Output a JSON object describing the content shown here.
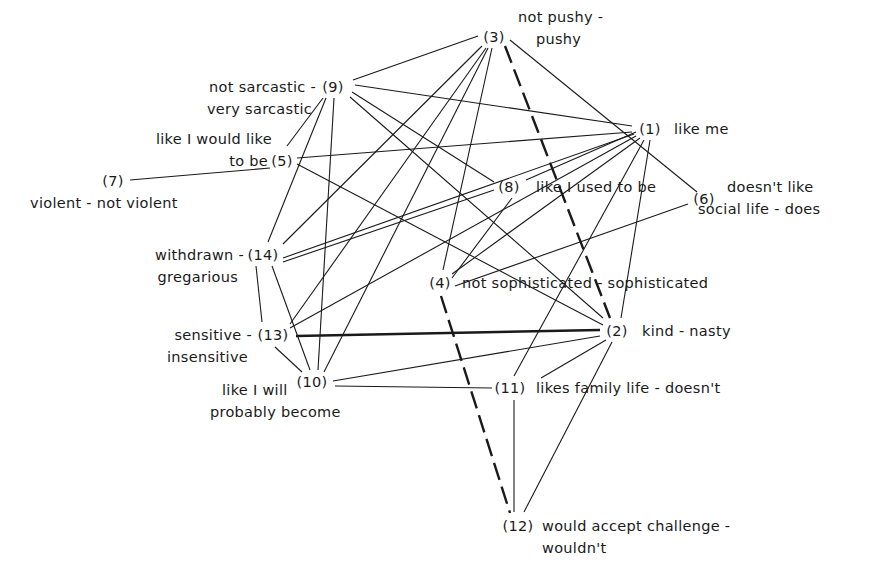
{
  "diagram": {
    "type": "correlation network (repertory grid constructs)",
    "nodes": [
      {
        "id": "1",
        "num": "(1)",
        "x": 650,
        "y": 128,
        "lines": [
          "like me"
        ],
        "label_x": 674,
        "label_y": 134,
        "num_anchor": "middle"
      },
      {
        "id": "2",
        "num": "(2)",
        "x": 617,
        "y": 330,
        "lines": [
          "kind - nasty"
        ],
        "label_x": 642,
        "label_y": 336,
        "num_anchor": "middle"
      },
      {
        "id": "3",
        "num": "(3)",
        "x": 494,
        "y": 36,
        "lines": [
          "not pushy -",
          "pushy"
        ],
        "label_x": 520,
        "label_y": 42,
        "num_anchor": "middle"
      },
      {
        "id": "4",
        "num": "(4)",
        "x": 440,
        "y": 282,
        "lines": [
          "not sophisticated - sophisticated"
        ],
        "label_x": 462,
        "label_y": 288,
        "num_anchor": "middle"
      },
      {
        "id": "5",
        "num": "(5)",
        "x": 282,
        "y": 160,
        "lines": [
          "like I would like",
          "to be"
        ],
        "label_x": 268,
        "label_y": 144,
        "num_anchor": "middle"
      },
      {
        "id": "6",
        "num": "(6)",
        "x": 704,
        "y": 198,
        "lines": [
          "doesn't like",
          "social life - does"
        ],
        "label_x": 727,
        "label_y": 204,
        "num_anchor": "middle"
      },
      {
        "id": "7",
        "num": "(7)",
        "x": 113,
        "y": 180,
        "lines": [
          "violent - not violent"
        ],
        "label_x": 30,
        "label_y": 208,
        "num_anchor": "middle"
      },
      {
        "id": "8",
        "num": "(8)",
        "x": 509,
        "y": 186,
        "lines": [
          "like I used to be"
        ],
        "label_x": 538,
        "label_y": 192,
        "num_anchor": "middle"
      },
      {
        "id": "9",
        "num": "(9)",
        "x": 333,
        "y": 86,
        "lines": [
          "not sarcastic -",
          "very sarcastic"
        ],
        "label_x": 316,
        "label_y": 92,
        "num_anchor": "middle"
      },
      {
        "id": "10",
        "num": "(10)",
        "x": 312,
        "y": 381,
        "lines": [
          "like I will",
          "probably become"
        ],
        "label_x": 210,
        "label_y": 398,
        "num_anchor": "middle"
      },
      {
        "id": "11",
        "num": "(11)",
        "x": 510,
        "y": 387,
        "lines": [
          "likes family life - doesn't"
        ],
        "label_x": 537,
        "label_y": 393,
        "num_anchor": "middle"
      },
      {
        "id": "12",
        "num": "(12)",
        "x": 518,
        "y": 525,
        "lines": [
          "would accept challenge -",
          "wouldn't"
        ],
        "label_x": 542,
        "label_y": 531,
        "num_anchor": "middle"
      },
      {
        "id": "13",
        "num": "(13)",
        "x": 273,
        "y": 334,
        "lines": [
          "sensitive -",
          "insensitive"
        ],
        "label_x": 252,
        "label_y": 340,
        "num_anchor": "middle"
      },
      {
        "id": "14",
        "num": "(14)",
        "x": 263,
        "y": 254,
        "lines": [
          "withdrawn -",
          "gregarious"
        ],
        "label_x": 243,
        "label_y": 260,
        "num_anchor": "middle"
      }
    ],
    "edges": [
      {
        "from": "3",
        "to": "9",
        "style": "thin",
        "path": [
          478,
          36,
          353,
          80
        ]
      },
      {
        "from": "3",
        "to": "14",
        "style": "thin",
        "path": [
          482,
          46,
          283,
          244
        ]
      },
      {
        "from": "3",
        "to": "13",
        "style": "thin",
        "path": [
          486,
          48,
          290,
          324
        ]
      },
      {
        "from": "3",
        "to": "10",
        "style": "thin",
        "path": [
          488,
          48,
          324,
          372
        ]
      },
      {
        "from": "3",
        "to": "4",
        "style": "thin",
        "path": [
          492,
          48,
          443,
          270
        ]
      },
      {
        "from": "3",
        "to": "2",
        "style": "heavy-dashed",
        "path": [
          505,
          46,
          610,
          318
        ]
      },
      {
        "from": "3",
        "to": "6",
        "style": "thin",
        "path": [
          510,
          40,
          697,
          192
        ]
      },
      {
        "from": "9",
        "to": "1",
        "style": "thin",
        "path": [
          355,
          85,
          632,
          126
        ]
      },
      {
        "from": "9",
        "to": "5",
        "style": "thin",
        "path": [
          323,
          98,
          287,
          146
        ]
      },
      {
        "from": "9",
        "to": "14",
        "style": "thin",
        "path": [
          326,
          98,
          268,
          242
        ]
      },
      {
        "from": "9",
        "to": "10",
        "style": "thin",
        "path": [
          334,
          98,
          318,
          370
        ]
      },
      {
        "from": "9",
        "to": "8",
        "style": "thin",
        "path": [
          352,
          92,
          494,
          182
        ]
      },
      {
        "from": "9",
        "to": "2",
        "style": "thin",
        "path": [
          350,
          97,
          603,
          318
        ]
      },
      {
        "from": "5",
        "to": "7",
        "style": "thin",
        "path": [
          270,
          168,
          130,
          180
        ]
      },
      {
        "from": "5",
        "to": "1",
        "style": "thin",
        "path": [
          297,
          158,
          632,
          132
        ]
      },
      {
        "from": "5",
        "to": "2",
        "style": "thin",
        "path": [
          297,
          164,
          603,
          325
        ]
      },
      {
        "from": "1",
        "to": "14",
        "style": "thin",
        "path": [
          634,
          134,
          283,
          258
        ]
      },
      {
        "from": "1",
        "to": "13",
        "style": "thin",
        "path": [
          636,
          136,
          290,
          328
        ]
      },
      {
        "from": "1",
        "to": "8",
        "style": "thin",
        "path": [
          636,
          132,
          526,
          180
        ]
      },
      {
        "from": "1",
        "to": "4",
        "style": "thin",
        "path": [
          640,
          138,
          452,
          274
        ]
      },
      {
        "from": "1",
        "to": "11",
        "style": "thin",
        "path": [
          644,
          140,
          514,
          376
        ]
      },
      {
        "from": "1",
        "to": "2",
        "style": "thin",
        "path": [
          650,
          140,
          621,
          318
        ]
      },
      {
        "from": "8",
        "to": "14",
        "style": "thin",
        "path": [
          494,
          190,
          283,
          262
        ]
      },
      {
        "from": "8",
        "to": "4",
        "style": "thin",
        "path": [
          512,
          198,
          452,
          278
        ]
      },
      {
        "from": "6",
        "to": "4",
        "style": "thin",
        "path": [
          688,
          204,
          455,
          286
        ]
      },
      {
        "from": "14",
        "to": "13",
        "style": "thin",
        "path": [
          256,
          266,
          262,
          322
        ]
      },
      {
        "from": "14",
        "to": "10",
        "style": "thin",
        "path": [
          272,
          266,
          310,
          370
        ]
      },
      {
        "from": "13",
        "to": "10",
        "style": "thin",
        "path": [
          275,
          347,
          302,
          372
        ]
      },
      {
        "from": "13",
        "to": "2",
        "style": "heavy",
        "path": [
          296,
          336,
          600,
          330
        ]
      },
      {
        "from": "10",
        "to": "2",
        "style": "thin",
        "path": [
          333,
          381,
          600,
          336
        ]
      },
      {
        "from": "10",
        "to": "11",
        "style": "thin",
        "path": [
          335,
          386,
          492,
          388
        ]
      },
      {
        "from": "4",
        "to": "12",
        "style": "heavy-dashed",
        "path": [
          441,
          296,
          510,
          513
        ]
      },
      {
        "from": "2",
        "to": "11",
        "style": "thin",
        "path": [
          606,
          340,
          541,
          378
        ]
      },
      {
        "from": "2",
        "to": "12",
        "style": "thin",
        "path": [
          612,
          342,
          524,
          512
        ]
      },
      {
        "from": "11",
        "to": "12",
        "style": "thin",
        "path": [
          514,
          400,
          514,
          512
        ]
      }
    ]
  }
}
